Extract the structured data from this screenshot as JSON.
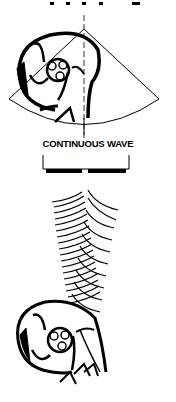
{
  "diagram": {
    "label": "CONTINUOUS WAVE",
    "colors": {
      "ink": "#000000",
      "background": "#ffffff"
    },
    "elements": [
      "top-cut-text-fragment",
      "ultrasound-sector-fan",
      "heart-cross-section-top",
      "transducer-bracket",
      "continuous-wave-arcs",
      "heart-cross-section-bottom"
    ]
  }
}
